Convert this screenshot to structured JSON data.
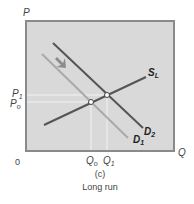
{
  "diagram": {
    "axes": {
      "y_label": "P",
      "x_label": "Q",
      "origin_label": "0"
    },
    "price_labels": [
      {
        "main": "P",
        "sub": "1"
      },
      {
        "main": "P",
        "sub": "o"
      }
    ],
    "quantity_labels": [
      {
        "main": "Q",
        "sub": "o"
      },
      {
        "main": "Q",
        "sub": "1"
      }
    ],
    "curves": [
      {
        "name": "S",
        "sub": "L",
        "kind": "supply",
        "color": "#555555"
      },
      {
        "name": "D",
        "sub": "2",
        "kind": "demand",
        "color": "#555555"
      },
      {
        "name": "D",
        "sub": "1",
        "kind": "demand",
        "color": "#aaaaaa"
      }
    ],
    "panel_letter": "(c)",
    "caption": "Long run",
    "colors": {
      "plot_bg": "#d9d9d9",
      "frame": "#8a8a8a",
      "arrow": "#8c8c8c",
      "guide": "#f2f2f2"
    }
  }
}
